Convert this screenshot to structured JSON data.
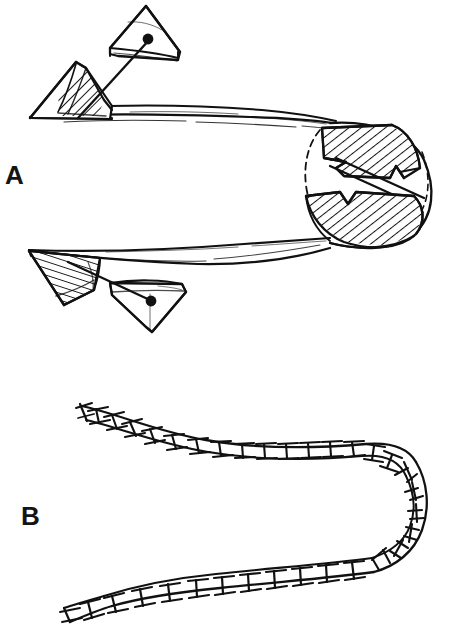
{
  "figure": {
    "background_color": "#ffffff",
    "ink_color": "#111111",
    "width": 451,
    "height": 628,
    "panels": [
      {
        "id": "A",
        "label": "A",
        "label_position": {
          "x": 5,
          "y": 162
        },
        "caption_text": "A",
        "description": "Hairpin-folded flattened ribbon body with two hatched triangular wedge appendages at the left ends, each tethered by a straight line to an outlined triangular plate; the right end forms a closed loop containing two opposed hatched arrowhead wedges."
      },
      {
        "id": "B",
        "label": "B",
        "label_position": {
          "x": 21,
          "y": 503
        },
        "caption_text": "B",
        "description": "Hairpin-folded segmented chain drawn as a ladder of paired rails with transverse rungs; the upper limb is narrow and the lower limb is wider, joined by a U-turn at the right."
      }
    ],
    "labels": {
      "a": "A",
      "b": "B"
    },
    "elements": {
      "panel_a": {
        "upper_ribbon": {
          "name": "upper-ribbon-strand",
          "start_x": 30,
          "start_y": 104,
          "end_x": 330,
          "end_y": 124
        },
        "lower_ribbon": {
          "name": "lower-ribbon-strand",
          "start_x": 30,
          "start_y": 250,
          "end_x": 330,
          "end_y": 240
        },
        "upper_hatched_wedge": {
          "name": "upper-hatched-wedge",
          "hatch_angle_deg": 45
        },
        "lower_hatched_wedge": {
          "name": "lower-hatched-wedge",
          "hatch_angle_deg": 20
        },
        "upper_outline_triangle": {
          "name": "upper-outline-triangle"
        },
        "lower_outline_triangle": {
          "name": "lower-outline-triangle"
        },
        "upper_tether": {
          "name": "upper-tether-line"
        },
        "lower_tether": {
          "name": "lower-tether-line"
        },
        "hairpin_loop": {
          "name": "hairpin-loop",
          "center_x": 360,
          "center_y": 182
        },
        "hairpin_arrow_upper": {
          "name": "hairpin-arrow-upper"
        },
        "hairpin_arrow_lower": {
          "name": "hairpin-arrow-lower"
        }
      },
      "panel_b": {
        "upper_chain": {
          "name": "upper-segmented-chain",
          "segment_count": 19
        },
        "lower_chain": {
          "name": "lower-segmented-chain",
          "segment_count": 17
        },
        "turn": {
          "name": "chain-u-turn",
          "segment_count": 7
        }
      }
    }
  }
}
